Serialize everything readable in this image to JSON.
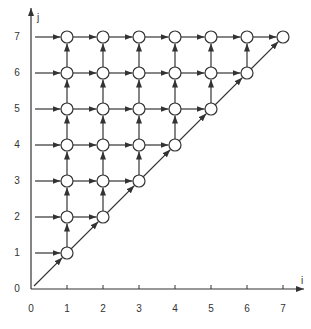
{
  "diagram": {
    "type": "lattice-dependency-graph",
    "axes": {
      "x_label": "i",
      "y_label": "j",
      "x_ticks": [
        "0",
        "1",
        "2",
        "3",
        "4",
        "5",
        "6",
        "7"
      ],
      "y_ticks": [
        "0",
        "1",
        "2",
        "3",
        "4",
        "5",
        "6",
        "7"
      ]
    },
    "nodes_rule": "circle at every (i, j) with 1 <= i <= j <= 7",
    "edges": {
      "horizontal": "arrow (i, j) -> (i+1, j) for i < j; arrow from j-axis into (1, j)",
      "vertical": "arrow (i, j) -> (i, j+1) for j < 7",
      "diagonal": "arrow (0,0) -> (1,1) and (i, i) -> (i+1, i+1)"
    },
    "colors": {
      "line": "#333333",
      "node_fill": "#ffffff",
      "node_stroke": "#333333"
    }
  }
}
